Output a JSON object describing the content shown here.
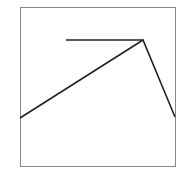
{
  "chart_data": {
    "type": "line",
    "title": "",
    "xlabel": "",
    "ylabel": "",
    "grid": false,
    "legend": null,
    "frame": {
      "x0": 20,
      "y0": 7,
      "x1": 175,
      "y1": 166,
      "stroke": "#888888"
    },
    "series": [
      {
        "name": "polyline",
        "color": "#222222",
        "points": [
          [
            20,
            118
          ],
          [
            143,
            40
          ],
          [
            175,
            117
          ]
        ]
      },
      {
        "name": "horizontal-segment",
        "color": "#222222",
        "points": [
          [
            66,
            40
          ],
          [
            143,
            40
          ]
        ]
      }
    ]
  }
}
